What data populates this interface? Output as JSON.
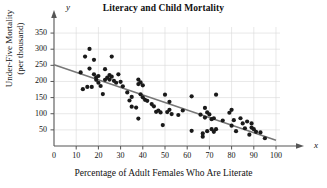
{
  "chart_data": {
    "type": "scatter",
    "title": "Literacy and Child Mortality",
    "xlabel": "Percentage of Adult Females Who Are Literate",
    "ylabel_line1": "Under-Five Mortality",
    "ylabel_line2": "(per thousand)",
    "x_axis_letter": "x",
    "y_axis_letter": "y",
    "xlim": [
      0,
      100
    ],
    "ylim": [
      0,
      375
    ],
    "xticks": [
      0,
      10,
      20,
      30,
      40,
      50,
      60,
      70,
      80,
      90,
      100
    ],
    "yticks": [
      50,
      100,
      150,
      200,
      250,
      300,
      350
    ],
    "grid": true,
    "legend": "none",
    "point_color": "#1a1a1a",
    "line_color": "#777777",
    "grid_color": "#d8d8d8",
    "axis_color": "#555555",
    "trendline": {
      "name": "least-squares regression line",
      "x": [
        0,
        100
      ],
      "y": [
        252,
        18
      ]
    },
    "points": [
      [
        12,
        228
      ],
      [
        13,
        176
      ],
      [
        14,
        277
      ],
      [
        15,
        183
      ],
      [
        16,
        301
      ],
      [
        16,
        240
      ],
      [
        17,
        183
      ],
      [
        18,
        267
      ],
      [
        18,
        222
      ],
      [
        19,
        213
      ],
      [
        19,
        205
      ],
      [
        20,
        217
      ],
      [
        20,
        196
      ],
      [
        21,
        186
      ],
      [
        22,
        161
      ],
      [
        23,
        238
      ],
      [
        23,
        205
      ],
      [
        24,
        212
      ],
      [
        25,
        220
      ],
      [
        25,
        206
      ],
      [
        26,
        277
      ],
      [
        26,
        215
      ],
      [
        27,
        202
      ],
      [
        28,
        196
      ],
      [
        29,
        222
      ],
      [
        30,
        199
      ],
      [
        31,
        185
      ],
      [
        33,
        166
      ],
      [
        34,
        141
      ],
      [
        35,
        152
      ],
      [
        35,
        122
      ],
      [
        37,
        119
      ],
      [
        38,
        206
      ],
      [
        38,
        192
      ],
      [
        38,
        85
      ],
      [
        39,
        197
      ],
      [
        39,
        160
      ],
      [
        40,
        188
      ],
      [
        40,
        151
      ],
      [
        41,
        143
      ],
      [
        42,
        140
      ],
      [
        44,
        130
      ],
      [
        45,
        123
      ],
      [
        46,
        106
      ],
      [
        47,
        110
      ],
      [
        48,
        104
      ],
      [
        49,
        65
      ],
      [
        50,
        159
      ],
      [
        51,
        105
      ],
      [
        52,
        137
      ],
      [
        52,
        112
      ],
      [
        53,
        99
      ],
      [
        56,
        96
      ],
      [
        58,
        110
      ],
      [
        62,
        154
      ],
      [
        62,
        47
      ],
      [
        66,
        97
      ],
      [
        67,
        29
      ],
      [
        67,
        39
      ],
      [
        68,
        118
      ],
      [
        68,
        88
      ],
      [
        69,
        104
      ],
      [
        69,
        46
      ],
      [
        70,
        98
      ],
      [
        71,
        83
      ],
      [
        71,
        52
      ],
      [
        72,
        86
      ],
      [
        72,
        44
      ],
      [
        73,
        159
      ],
      [
        73,
        52
      ],
      [
        76,
        79
      ],
      [
        79,
        103
      ],
      [
        80,
        112
      ],
      [
        80,
        63
      ],
      [
        81,
        80
      ],
      [
        82,
        46
      ],
      [
        84,
        86
      ],
      [
        85,
        70
      ],
      [
        86,
        55
      ],
      [
        87,
        76
      ],
      [
        88,
        35
      ],
      [
        89,
        57
      ],
      [
        89,
        70
      ],
      [
        90,
        52
      ],
      [
        91,
        44
      ],
      [
        93,
        42
      ],
      [
        95,
        24
      ]
    ]
  }
}
